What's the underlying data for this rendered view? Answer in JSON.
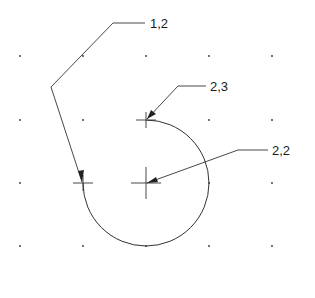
{
  "diagram": {
    "type": "cad-arc-construction",
    "grid": {
      "xs": [
        20,
        83,
        146,
        209,
        272
      ],
      "ys": [
        56,
        120,
        183,
        246
      ]
    },
    "arc": {
      "center": [
        146,
        183
      ],
      "radius": 63,
      "start": "top",
      "end": "left",
      "direction": "clockwise"
    },
    "labels": [
      {
        "id": "start-point",
        "text": "1,2",
        "x": 150,
        "y": 28
      },
      {
        "id": "end-point",
        "text": "2,3",
        "x": 210,
        "y": 91
      },
      {
        "id": "center-point",
        "text": "2,2",
        "x": 272,
        "y": 155
      }
    ],
    "colors": {
      "line": "#333333",
      "text": "#1a1a1a",
      "background": "#ffffff"
    }
  }
}
